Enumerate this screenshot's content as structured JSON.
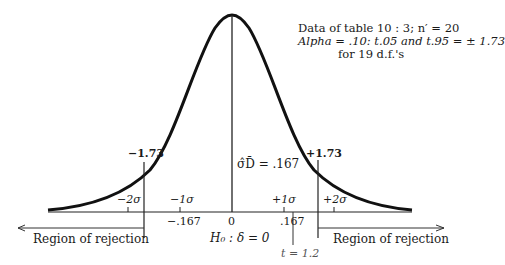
{
  "figure": {
    "note": {
      "line1": "Data of table 10 : 3; n′ = 20",
      "line2": "Alpha = .10: t.05 and t.95 = ± 1.73",
      "line3": "for 19 d.f.'s"
    },
    "critical_left": "−1.73",
    "critical_right": "+1.73",
    "sigma_label": "σ̂D̄ = .167",
    "ticks_sigma": [
      "−2σ",
      "−1σ",
      "+1σ",
      "+2σ"
    ],
    "ticks_values": [
      "−.167",
      "0",
      ".167"
    ],
    "h0": "H₀ : δ = 0",
    "t_obs": "t = 1.2",
    "region_left": "Region of rejection",
    "region_right": "Region of rejection"
  }
}
